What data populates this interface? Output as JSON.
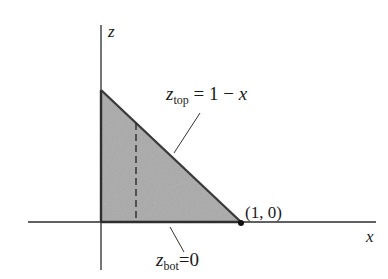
{
  "diagram": {
    "axes": {
      "z_label": "z",
      "x_label": "x"
    },
    "curves": {
      "top": {
        "var": "z",
        "subscript": "top",
        "equals": "=",
        "expr": "1 − ",
        "expr_var": "x"
      },
      "bottom": {
        "var": "z",
        "subscript": "bot",
        "equals": "=",
        "expr": "0"
      }
    },
    "point_label": "(1, 0)",
    "colors": {
      "fill": "#b3b3b3",
      "stroke": "#3a3a3a",
      "axis": "#2b2b2b",
      "background": "#ffffff"
    },
    "region": "triangle bounded by z = 1 − x, z = 0, x = 0",
    "dashed_slice": "vertical strip at x ≈ 0.25"
  }
}
